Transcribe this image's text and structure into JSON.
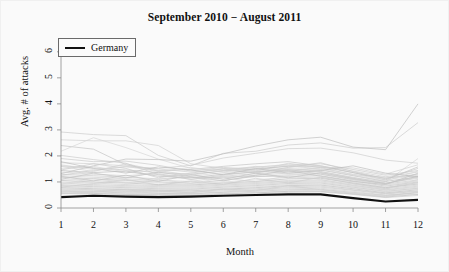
{
  "chart_data": {
    "type": "line",
    "title": "September 2010 − August 2011",
    "xlabel": "Month",
    "ylabel": "Avg. # of attacks",
    "xlim": [
      1,
      12
    ],
    "ylim": [
      0,
      6.3
    ],
    "x": [
      1,
      2,
      3,
      4,
      5,
      6,
      7,
      8,
      9,
      10,
      11,
      12
    ],
    "xticks": [
      "1",
      "2",
      "3",
      "4",
      "5",
      "6",
      "7",
      "8",
      "9",
      "10",
      "11",
      "12"
    ],
    "yticks": [
      "0",
      "1",
      "2",
      "3",
      "4",
      "5",
      "6"
    ],
    "grid": false,
    "legend": {
      "position": "top-left",
      "entries": [
        {
          "name": "Germany",
          "color": "#111111",
          "width": 2.2
        }
      ]
    },
    "highlight_color": "#111111",
    "background_color": "#fafafa",
    "series": [
      {
        "name": "Germany",
        "highlight": true,
        "color": "#111111",
        "values": [
          0.42,
          0.47,
          0.44,
          0.42,
          0.44,
          0.47,
          0.5,
          0.52,
          0.52,
          0.38,
          0.25,
          0.31
        ]
      },
      {
        "name": "country-01",
        "values": [
          2.92,
          2.82,
          2.78,
          2.02,
          1.62,
          2.1,
          2.18,
          2.42,
          2.5,
          2.3,
          2.32,
          3.28
        ]
      },
      {
        "name": "country-02",
        "values": [
          2.62,
          2.58,
          2.58,
          2.4,
          1.7,
          1.52,
          1.42,
          1.72,
          1.55,
          1.28,
          1.18,
          1.22
        ]
      },
      {
        "name": "country-03",
        "values": [
          2.4,
          2.26,
          1.66,
          1.42,
          1.48,
          1.6,
          1.7,
          1.78,
          1.62,
          1.36,
          1.08,
          1.58
        ]
      },
      {
        "name": "country-04",
        "values": [
          2.18,
          2.7,
          2.32,
          1.88,
          1.52,
          1.44,
          1.38,
          1.52,
          1.4,
          1.16,
          1.0,
          1.9
        ]
      },
      {
        "name": "country-05",
        "values": [
          1.32,
          1.62,
          1.88,
          1.86,
          1.8,
          2.08,
          2.38,
          2.62,
          2.72,
          2.34,
          2.24,
          4.0
        ]
      },
      {
        "name": "country-06",
        "values": [
          1.26,
          1.44,
          1.58,
          1.52,
          1.64,
          1.92,
          2.1,
          2.28,
          2.3,
          2.12,
          1.84,
          1.72
        ]
      },
      {
        "name": "country-07",
        "values": [
          1.9,
          1.78,
          1.8,
          1.64,
          1.42,
          1.56,
          1.48,
          1.62,
          1.7,
          1.48,
          1.26,
          1.44
        ]
      },
      {
        "name": "country-08",
        "values": [
          1.74,
          1.7,
          1.62,
          1.5,
          1.38,
          1.5,
          1.56,
          1.68,
          1.62,
          1.42,
          1.2,
          1.38
        ]
      },
      {
        "name": "country-09",
        "values": [
          1.62,
          1.54,
          1.46,
          1.36,
          1.3,
          1.42,
          1.5,
          1.6,
          1.58,
          1.36,
          1.14,
          1.3
        ]
      },
      {
        "name": "country-10",
        "values": [
          1.52,
          1.6,
          1.38,
          1.28,
          1.22,
          1.36,
          1.44,
          1.54,
          1.52,
          1.3,
          1.08,
          1.26
        ]
      },
      {
        "name": "country-11",
        "values": [
          1.44,
          1.36,
          1.42,
          1.22,
          1.16,
          1.3,
          1.38,
          1.46,
          1.46,
          1.24,
          1.02,
          1.2
        ]
      },
      {
        "name": "country-12",
        "values": [
          1.38,
          1.3,
          1.24,
          1.32,
          1.1,
          1.22,
          1.32,
          1.4,
          1.4,
          1.18,
          0.96,
          1.14
        ]
      },
      {
        "name": "country-13",
        "values": [
          1.3,
          1.24,
          1.18,
          1.12,
          1.18,
          1.16,
          1.26,
          1.34,
          1.34,
          1.12,
          0.92,
          1.08
        ]
      },
      {
        "name": "country-14",
        "values": [
          1.24,
          1.18,
          1.12,
          1.06,
          1.02,
          1.2,
          1.2,
          1.28,
          1.3,
          1.08,
          0.88,
          1.04
        ]
      },
      {
        "name": "country-15",
        "values": [
          1.18,
          1.12,
          1.06,
          1.0,
          0.96,
          1.06,
          1.22,
          1.22,
          1.24,
          1.04,
          0.84,
          1.0
        ]
      },
      {
        "name": "country-16",
        "values": [
          1.12,
          1.06,
          1.0,
          0.96,
          0.92,
          1.0,
          1.08,
          1.18,
          1.18,
          1.0,
          0.8,
          0.96
        ]
      },
      {
        "name": "country-17",
        "values": [
          1.06,
          1.0,
          0.96,
          0.9,
          0.88,
          0.96,
          1.02,
          1.12,
          1.14,
          0.96,
          0.78,
          0.92
        ]
      },
      {
        "name": "country-18",
        "values": [
          1.0,
          0.96,
          0.9,
          0.86,
          0.84,
          0.92,
          0.98,
          1.06,
          1.08,
          0.92,
          0.74,
          0.88
        ]
      },
      {
        "name": "country-19",
        "values": [
          0.96,
          0.9,
          0.86,
          0.82,
          0.8,
          0.88,
          0.94,
          1.02,
          1.04,
          0.88,
          0.7,
          0.84
        ]
      },
      {
        "name": "country-20",
        "values": [
          0.9,
          0.86,
          0.82,
          0.78,
          0.76,
          0.84,
          0.9,
          0.98,
          1.0,
          0.84,
          0.68,
          0.8
        ]
      },
      {
        "name": "country-21",
        "values": [
          0.86,
          0.82,
          0.78,
          0.74,
          0.72,
          0.8,
          0.86,
          0.94,
          0.96,
          0.8,
          0.64,
          0.76
        ]
      },
      {
        "name": "country-22",
        "values": [
          0.82,
          0.78,
          0.74,
          0.7,
          0.7,
          0.76,
          0.82,
          0.9,
          0.92,
          0.78,
          0.62,
          0.74
        ]
      },
      {
        "name": "country-23",
        "values": [
          0.78,
          0.74,
          0.7,
          0.68,
          0.66,
          0.72,
          0.78,
          0.86,
          0.88,
          0.74,
          0.58,
          0.7
        ]
      },
      {
        "name": "country-24",
        "values": [
          0.74,
          0.7,
          0.68,
          0.64,
          0.62,
          0.7,
          0.74,
          0.82,
          0.84,
          0.7,
          0.56,
          0.66
        ]
      },
      {
        "name": "country-25",
        "values": [
          0.7,
          0.68,
          0.64,
          0.62,
          0.6,
          0.66,
          0.7,
          0.78,
          0.8,
          0.68,
          0.54,
          0.64
        ]
      },
      {
        "name": "country-26",
        "values": [
          0.68,
          0.64,
          0.62,
          0.58,
          0.56,
          0.62,
          0.68,
          0.74,
          0.76,
          0.64,
          0.5,
          0.6
        ]
      },
      {
        "name": "country-27",
        "values": [
          0.64,
          0.62,
          0.58,
          0.56,
          0.54,
          0.6,
          0.64,
          0.7,
          0.72,
          0.6,
          0.48,
          0.58
        ]
      },
      {
        "name": "country-28",
        "values": [
          0.62,
          0.58,
          0.56,
          0.52,
          0.52,
          0.56,
          0.6,
          0.66,
          0.68,
          0.58,
          0.46,
          0.54
        ]
      },
      {
        "name": "country-29",
        "values": [
          0.58,
          0.56,
          0.52,
          0.5,
          0.48,
          0.54,
          0.58,
          0.64,
          0.64,
          0.54,
          0.42,
          0.52
        ]
      },
      {
        "name": "country-30",
        "values": [
          0.56,
          0.52,
          0.5,
          0.48,
          0.46,
          0.5,
          0.54,
          0.6,
          0.62,
          0.52,
          0.4,
          0.48
        ]
      },
      {
        "name": "country-31",
        "values": [
          1.46,
          1.7,
          1.52,
          1.16,
          1.34,
          1.5,
          1.34,
          1.56,
          1.74,
          1.4,
          1.12,
          1.52
        ]
      },
      {
        "name": "country-32",
        "values": [
          1.6,
          1.4,
          1.7,
          1.44,
          1.26,
          1.44,
          1.6,
          1.4,
          1.56,
          1.54,
          1.3,
          1.66
        ]
      },
      {
        "name": "country-33",
        "values": [
          1.1,
          1.34,
          1.16,
          1.38,
          1.2,
          1.04,
          1.26,
          1.44,
          1.22,
          1.02,
          0.9,
          1.34
        ]
      },
      {
        "name": "country-34",
        "values": [
          0.92,
          1.14,
          0.96,
          1.1,
          0.94,
          1.16,
          1.0,
          1.24,
          1.1,
          0.86,
          0.72,
          1.1
        ]
      },
      {
        "name": "country-35",
        "values": [
          1.78,
          1.52,
          1.34,
          1.58,
          1.46,
          1.28,
          1.52,
          1.34,
          1.44,
          1.62,
          1.34,
          1.2
        ]
      },
      {
        "name": "country-36",
        "values": [
          0.8,
          0.94,
          1.1,
          0.88,
          1.04,
          0.9,
          1.14,
          0.96,
          1.18,
          0.94,
          0.76,
          0.98
        ]
      },
      {
        "name": "country-37",
        "values": [
          2.02,
          1.86,
          1.72,
          1.28,
          1.1,
          1.26,
          1.4,
          1.48,
          1.3,
          1.1,
          0.94,
          1.18
        ]
      },
      {
        "name": "country-38",
        "values": [
          0.54,
          0.6,
          0.72,
          0.66,
          0.58,
          0.74,
          0.66,
          0.86,
          0.7,
          0.56,
          0.44,
          0.62
        ]
      },
      {
        "name": "country-39",
        "values": [
          1.22,
          1.04,
          1.26,
          1.02,
          1.28,
          1.1,
          1.34,
          1.16,
          1.36,
          1.14,
          0.94,
          1.22
        ]
      },
      {
        "name": "country-40",
        "values": [
          1.66,
          1.48,
          1.6,
          1.4,
          1.56,
          1.38,
          1.58,
          1.64,
          1.48,
          1.26,
          1.04,
          1.42
        ]
      }
    ]
  }
}
